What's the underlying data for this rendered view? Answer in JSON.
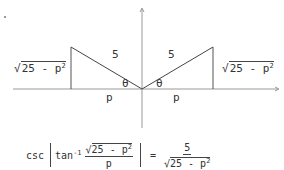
{
  "diagram": {
    "type": "reference-triangles",
    "axes": {
      "origin": [
        142,
        89
      ],
      "x_arrow": "right",
      "y_arrow": "up"
    },
    "left_triangle": {
      "hypotenuse_label": "5",
      "angle_label": "θ",
      "base_label": "p",
      "height_label": {
        "radicand": "25 - p",
        "exponent": "2",
        "text": "√(25 - p²)"
      }
    },
    "right_triangle": {
      "hypotenuse_label": "5",
      "angle_label": "θ",
      "base_label": "p",
      "height_label": {
        "radicand": "25 - p",
        "exponent": "2",
        "text": "√(25 - p²)"
      }
    }
  },
  "formula": {
    "text": "csc |tan⁻¹ (√(25 - p²) / p)| = 5 / √(25 - p²)",
    "outer_fn": "csc",
    "inner_fn": "tan",
    "inner_exponent": "-1",
    "inner_fraction": {
      "numerator_radicand": "25 - p",
      "numerator_exponent": "2",
      "denominator": "p"
    },
    "equals": "=",
    "result_fraction": {
      "numerator": "5",
      "denominator_radicand": "25 - p",
      "denominator_exponent": "2"
    }
  },
  "colors": {
    "line": "#444444",
    "axis": "#888888",
    "text": "#333333",
    "background": "#ffffff"
  }
}
